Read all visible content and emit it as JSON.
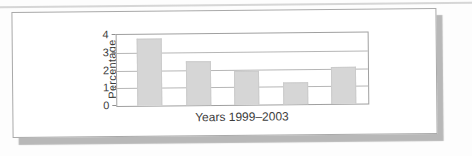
{
  "chart_data": {
    "type": "bar",
    "categories": [
      "1999",
      "2000",
      "2001",
      "2002",
      "2003"
    ],
    "values": [
      3.8,
      2.5,
      1.9,
      1.25,
      2.1
    ],
    "title": "",
    "xlabel": "Years 1999–2003",
    "ylabel": "Percentage",
    "ylim": [
      0,
      4
    ],
    "yticks": [
      4,
      3,
      2,
      1,
      0
    ],
    "grid": true,
    "legend": "none",
    "colors": {
      "bar_fill": "#d6d6d6",
      "bar_border": "#cbcbcb",
      "gridline": "#b6b6b6",
      "plot_border": "#a0a0a0",
      "text": "#3c3c3c",
      "card_shadow": "#b8b8b8"
    }
  }
}
